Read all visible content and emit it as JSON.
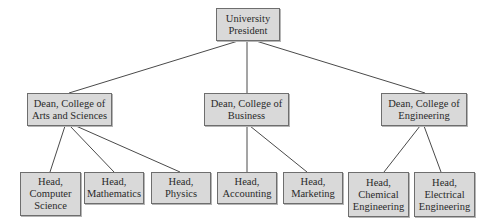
{
  "diagram": {
    "type": "org-chart",
    "colors": {
      "box_fill": "#d9d9d9",
      "box_border": "#6e6e6e",
      "line": "#4a4a4a",
      "text": "#2a2a2a",
      "background": "#ffffff"
    },
    "root": {
      "id": "president",
      "label": "University\nPresident"
    },
    "deans": [
      {
        "id": "dean-arts-sciences",
        "label": "Dean, College of\nArts and Sciences"
      },
      {
        "id": "dean-business",
        "label": "Dean, College of\nBusiness"
      },
      {
        "id": "dean-engineering",
        "label": "Dean, College of\nEngineering"
      }
    ],
    "heads": [
      {
        "id": "head-computer-science",
        "parent": "dean-arts-sciences",
        "label": "Head,\nComputer\nScience"
      },
      {
        "id": "head-mathematics",
        "parent": "dean-arts-sciences",
        "label": "Head,\nMathematics"
      },
      {
        "id": "head-physics",
        "parent": "dean-arts-sciences",
        "label": "Head,\nPhysics"
      },
      {
        "id": "head-accounting",
        "parent": "dean-business",
        "label": "Head,\nAccounting"
      },
      {
        "id": "head-marketing",
        "parent": "dean-business",
        "label": "Head,\nMarketing"
      },
      {
        "id": "head-chemical-engineering",
        "parent": "dean-engineering",
        "label": "Head,\nChemical\nEngineering"
      },
      {
        "id": "head-electrical-engineering",
        "parent": "dean-engineering",
        "label": "Head,\nElectrical\nEngineering"
      }
    ],
    "edges": [
      [
        "president",
        "dean-arts-sciences"
      ],
      [
        "president",
        "dean-business"
      ],
      [
        "president",
        "dean-engineering"
      ],
      [
        "dean-arts-sciences",
        "head-computer-science"
      ],
      [
        "dean-arts-sciences",
        "head-mathematics"
      ],
      [
        "dean-arts-sciences",
        "head-physics"
      ],
      [
        "dean-business",
        "head-accounting"
      ],
      [
        "dean-business",
        "head-marketing"
      ],
      [
        "dean-engineering",
        "head-chemical-engineering"
      ],
      [
        "dean-engineering",
        "head-electrical-engineering"
      ]
    ]
  }
}
